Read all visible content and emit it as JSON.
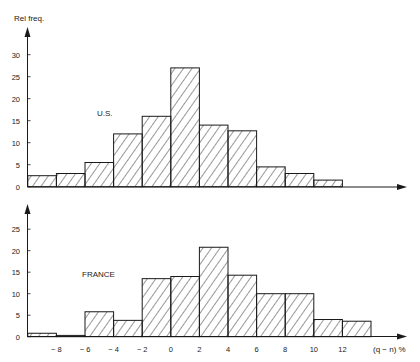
{
  "chart_data": [
    {
      "type": "bar",
      "panel": "top",
      "title": "U.S.",
      "ylabel": "Rel freq.",
      "xlabel": "",
      "ylim": [
        0,
        35
      ],
      "yticks": [
        0,
        5,
        10,
        15,
        20,
        25,
        30
      ],
      "bin_width": 2,
      "bin_edges": [
        -10,
        -8,
        -6,
        -4,
        -2,
        0,
        2,
        4,
        6,
        8,
        10,
        12
      ],
      "values": [
        2.5,
        3,
        5.5,
        12,
        16,
        27,
        14,
        12.7,
        4.5,
        3,
        1.5
      ],
      "grid": false,
      "fill": "hatched"
    },
    {
      "type": "bar",
      "panel": "bottom",
      "title": "FRANCE",
      "ylabel": "",
      "xlabel": "(q − n) %",
      "ylim": [
        0,
        30
      ],
      "yticks": [
        0,
        5,
        10,
        15,
        20,
        25
      ],
      "xticks": [
        -8,
        -6,
        -4,
        -2,
        0,
        2,
        4,
        6,
        8,
        10,
        12
      ],
      "bin_width": 2,
      "bin_edges": [
        -10,
        -8,
        -6,
        -4,
        -2,
        0,
        2,
        4,
        6,
        8,
        10,
        12,
        14
      ],
      "values": [
        0.8,
        0.3,
        5.8,
        3.8,
        13.5,
        14,
        20.8,
        14.3,
        10,
        10,
        4,
        3.6
      ],
      "grid": false,
      "fill": "hatched"
    }
  ],
  "labels": {
    "ylabel": "Rel freq.",
    "us_title": "U.S.",
    "france_title": "FRANCE",
    "xlabel": "(q − n) %"
  },
  "style": {
    "ink": "#1a1a1a",
    "background": "#ffffff"
  }
}
